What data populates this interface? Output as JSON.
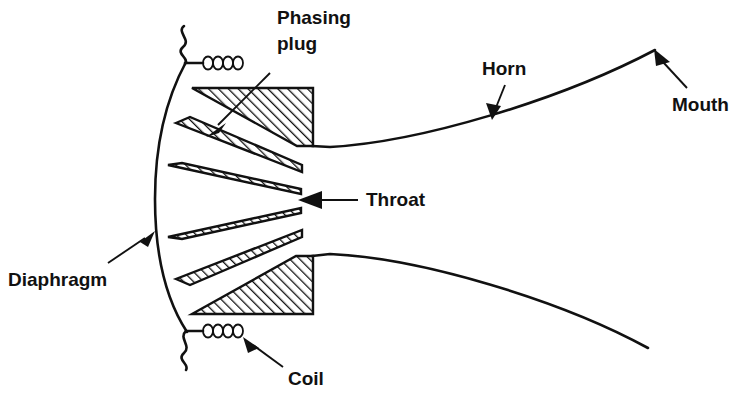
{
  "figure": {
    "background_color": "#ffffff",
    "line_color": "#111111",
    "width": 742,
    "height": 403
  },
  "labels": {
    "phasing_plug_line1": "Phasing",
    "phasing_plug_line2": "plug",
    "horn": "Horn",
    "mouth": "Mouth",
    "throat": "Throat",
    "diaphragm": "Diaphragm",
    "coil": "Coil"
  },
  "components": {
    "phasing_plug": {
      "name": "Phasing plug",
      "wedge_count": 6,
      "hatch_angle_deg": 45
    },
    "diaphragm": {
      "name": "Diaphragm",
      "shape": "curved dome arc"
    },
    "coil": {
      "name": "Coil",
      "loop_count": 4
    },
    "throat": {
      "name": "Throat"
    },
    "horn": {
      "name": "Horn",
      "flare": "exponential"
    },
    "mouth": {
      "name": "Mouth"
    }
  }
}
